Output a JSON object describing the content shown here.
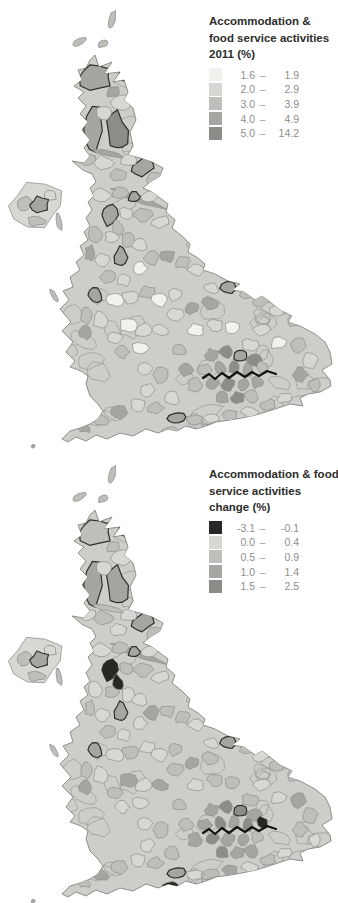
{
  "page": {
    "width": 338,
    "height": 903,
    "background": "#ffffff"
  },
  "legend_top": {
    "title_lines": [
      "Accommodation &",
      "food service activities",
      "2011 (%)"
    ],
    "dash": "–",
    "rows": [
      {
        "min": "1.6",
        "max": "1.9"
      },
      {
        "min": "2.0",
        "max": "2.9"
      },
      {
        "min": "3.0",
        "max": "3.9"
      },
      {
        "min": "4.0",
        "max": "4.9"
      },
      {
        "min": "5.0",
        "max": "14.2"
      }
    ]
  },
  "legend_bottom": {
    "title_lines": [
      "Accommodation & food",
      "service activities",
      "change (%)"
    ],
    "dash": "–",
    "rows": [
      {
        "min": "-3.1",
        "max": "-0.1"
      },
      {
        "min": "0.0",
        "max": "0.4"
      },
      {
        "min": "0.5",
        "max": "0.9"
      },
      {
        "min": "1.0",
        "max": "1.4"
      },
      {
        "min": "1.5",
        "max": "2.5"
      }
    ]
  },
  "map": {
    "type": "choropleth-cartogram",
    "area_shown": "Great Britain and Northern Ireland local authorities",
    "base_fill": "#cdcdc9",
    "outline_gray": "#8f8f8b",
    "outline_black": "#2e2e2c",
    "thames_color": "#141412",
    "palette_top": [
      "#f1f1ee",
      "#d7d7d3",
      "#bebeba",
      "#a5a5a1",
      "#8c8c89"
    ],
    "palette_bottom": [
      "#272725",
      "#d7d7d3",
      "#bebeba",
      "#a5a5a1",
      "#8c8c89"
    ],
    "offset_top": [
      0,
      0
    ],
    "offset_bottom": [
      0,
      455
    ],
    "thames": [
      [
        203,
        378
      ],
      [
        209,
        374
      ],
      [
        215,
        379
      ],
      [
        222,
        373
      ],
      [
        229,
        378
      ],
      [
        237,
        372
      ],
      [
        245,
        377
      ],
      [
        252,
        372
      ],
      [
        259,
        376
      ],
      [
        267,
        371
      ],
      [
        276,
        374
      ]
    ],
    "regions": [
      [
        95,
        77,
        16,
        13,
        0,
        3,
        2,
        1
      ],
      [
        130,
        73,
        11,
        7,
        -25,
        3,
        3,
        1
      ],
      [
        113,
        92,
        7,
        5,
        -15,
        3,
        2,
        0
      ],
      [
        121,
        103,
        10,
        8,
        0,
        1,
        1,
        0
      ],
      [
        94,
        130,
        10,
        21,
        5,
        3,
        3,
        1
      ],
      [
        117,
        132,
        10,
        20,
        -8,
        4,
        3,
        1
      ],
      [
        104,
        112,
        8,
        7,
        0,
        1,
        1,
        0
      ],
      [
        88,
        160,
        8,
        6,
        0,
        2,
        1,
        0
      ],
      [
        104,
        163,
        9,
        7,
        0,
        1,
        2,
        0
      ],
      [
        143,
        167,
        12,
        8,
        -20,
        3,
        3,
        1
      ],
      [
        155,
        178,
        9,
        6,
        -15,
        2,
        2,
        0
      ],
      [
        128,
        160,
        8,
        6,
        0,
        1,
        1,
        0
      ],
      [
        118,
        175,
        9,
        6,
        10,
        2,
        1,
        0
      ],
      [
        107,
        153,
        18,
        3,
        10,
        3,
        2,
        0
      ],
      [
        136,
        198,
        28,
        3,
        20,
        3,
        3,
        0
      ],
      [
        102,
        195,
        9,
        7,
        0,
        1,
        1,
        0
      ],
      [
        120,
        193,
        8,
        6,
        0,
        2,
        2,
        0
      ],
      [
        134,
        197,
        6,
        5,
        0,
        3,
        3,
        1
      ],
      [
        150,
        196,
        8,
        6,
        -10,
        1,
        1,
        0
      ],
      [
        110,
        215,
        8,
        10,
        0,
        3,
        0,
        1
      ],
      [
        126,
        213,
        7,
        6,
        0,
        1,
        2,
        0
      ],
      [
        118,
        228,
        5,
        8,
        -20,
        2,
        0,
        0
      ],
      [
        143,
        215,
        9,
        7,
        0,
        2,
        2,
        0
      ],
      [
        160,
        222,
        8,
        6,
        -15,
        1,
        1,
        0
      ],
      [
        95,
        235,
        7,
        8,
        0,
        2,
        1,
        0
      ],
      [
        112,
        237,
        7,
        6,
        0,
        1,
        2,
        0
      ],
      [
        128,
        240,
        7,
        9,
        0,
        2,
        1,
        0
      ],
      [
        121,
        257,
        6,
        10,
        5,
        3,
        3,
        1
      ],
      [
        140,
        245,
        8,
        6,
        0,
        1,
        1,
        0
      ],
      [
        90,
        253,
        5,
        8,
        0,
        3,
        2,
        0
      ],
      [
        103,
        260,
        7,
        7,
        0,
        1,
        1,
        0
      ],
      [
        152,
        258,
        8,
        7,
        0,
        2,
        3,
        0
      ],
      [
        168,
        256,
        7,
        6,
        0,
        3,
        2,
        0
      ],
      [
        183,
        262,
        8,
        6,
        -10,
        2,
        2,
        0
      ],
      [
        196,
        270,
        8,
        6,
        0,
        1,
        1,
        0
      ],
      [
        140,
        268,
        7,
        6,
        0,
        0,
        1,
        0
      ],
      [
        108,
        277,
        8,
        6,
        0,
        2,
        2,
        0
      ],
      [
        124,
        280,
        7,
        6,
        0,
        1,
        1,
        0
      ],
      [
        95,
        295,
        7,
        7,
        0,
        3,
        3,
        1
      ],
      [
        86,
        315,
        6,
        8,
        0,
        2,
        2,
        0
      ],
      [
        85,
        332,
        6,
        7,
        0,
        3,
        3,
        0
      ],
      [
        100,
        320,
        7,
        8,
        0,
        1,
        1,
        0
      ],
      [
        115,
        300,
        8,
        7,
        0,
        0,
        1,
        0
      ],
      [
        130,
        297,
        8,
        6,
        0,
        1,
        2,
        0
      ],
      [
        147,
        292,
        8,
        6,
        0,
        2,
        1,
        0
      ],
      [
        128,
        325,
        8,
        8,
        0,
        0,
        3,
        0
      ],
      [
        115,
        338,
        7,
        6,
        0,
        1,
        2,
        0
      ],
      [
        143,
        330,
        8,
        7,
        0,
        1,
        1,
        0
      ],
      [
        160,
        300,
        8,
        7,
        0,
        0,
        1,
        0
      ],
      [
        175,
        295,
        7,
        6,
        0,
        1,
        2,
        0
      ],
      [
        160,
        330,
        8,
        6,
        0,
        1,
        3,
        0
      ],
      [
        140,
        348,
        8,
        6,
        0,
        0,
        1,
        0
      ],
      [
        122,
        352,
        7,
        6,
        0,
        2,
        1,
        0
      ],
      [
        175,
        315,
        8,
        7,
        0,
        1,
        2,
        0
      ],
      [
        192,
        308,
        7,
        6,
        0,
        3,
        3,
        0
      ],
      [
        210,
        303,
        8,
        6,
        0,
        3,
        2,
        0
      ],
      [
        228,
        287,
        8,
        7,
        -10,
        3,
        3,
        1
      ],
      [
        247,
        292,
        8,
        6,
        0,
        2,
        2,
        0
      ],
      [
        212,
        288,
        7,
        5,
        0,
        1,
        1,
        0
      ],
      [
        196,
        330,
        8,
        6,
        0,
        0,
        1,
        0
      ],
      [
        215,
        325,
        8,
        6,
        0,
        1,
        2,
        0
      ],
      [
        232,
        328,
        7,
        6,
        0,
        0,
        2,
        0
      ],
      [
        262,
        300,
        9,
        6,
        -10,
        2,
        1,
        0
      ],
      [
        278,
        310,
        8,
        6,
        -15,
        1,
        2,
        0
      ],
      [
        295,
        320,
        8,
        6,
        -20,
        2,
        2,
        0
      ],
      [
        262,
        330,
        8,
        6,
        0,
        1,
        1,
        0
      ],
      [
        278,
        343,
        8,
        6,
        -15,
        0,
        1,
        0
      ],
      [
        298,
        345,
        8,
        7,
        -20,
        2,
        3,
        0
      ],
      [
        310,
        360,
        7,
        8,
        -10,
        1,
        2,
        0
      ],
      [
        300,
        375,
        7,
        7,
        0,
        3,
        2,
        0
      ],
      [
        315,
        385,
        6,
        7,
        0,
        2,
        1,
        0
      ],
      [
        250,
        345,
        8,
        6,
        0,
        1,
        2,
        0
      ],
      [
        212,
        355,
        7,
        6,
        0,
        3,
        3,
        0
      ],
      [
        226,
        352,
        7,
        6,
        0,
        4,
        4,
        0
      ],
      [
        240,
        356,
        7,
        6,
        0,
        3,
        4,
        1
      ],
      [
        254,
        360,
        7,
        6,
        0,
        4,
        3,
        0
      ],
      [
        205,
        370,
        7,
        6,
        0,
        2,
        3,
        0
      ],
      [
        220,
        368,
        6,
        6,
        0,
        3,
        4,
        0
      ],
      [
        234,
        368,
        6,
        6,
        0,
        4,
        3,
        0
      ],
      [
        248,
        370,
        6,
        6,
        0,
        3,
        4,
        0
      ],
      [
        262,
        368,
        6,
        6,
        0,
        2,
        0,
        0
      ],
      [
        212,
        383,
        7,
        6,
        0,
        3,
        4,
        0
      ],
      [
        228,
        385,
        7,
        6,
        0,
        4,
        3,
        0
      ],
      [
        243,
        384,
        6,
        6,
        0,
        3,
        3,
        0
      ],
      [
        257,
        382,
        6,
        6,
        0,
        3,
        2,
        0
      ],
      [
        222,
        398,
        7,
        6,
        0,
        3,
        4,
        0
      ],
      [
        238,
        398,
        7,
        6,
        0,
        4,
        3,
        0
      ],
      [
        195,
        385,
        7,
        7,
        0,
        2,
        3,
        0
      ],
      [
        186,
        370,
        7,
        6,
        0,
        3,
        2,
        0
      ],
      [
        252,
        396,
        7,
        6,
        0,
        2,
        3,
        0
      ],
      [
        180,
        350,
        7,
        6,
        0,
        2,
        2,
        0
      ],
      [
        172,
        398,
        8,
        6,
        0,
        1,
        2,
        0
      ],
      [
        176,
        418,
        9,
        6,
        -5,
        3,
        3,
        1
      ],
      [
        171,
        431,
        9,
        4,
        -12,
        2,
        0,
        0
      ],
      [
        195,
        420,
        8,
        5,
        0,
        2,
        1,
        0
      ],
      [
        212,
        418,
        8,
        5,
        0,
        1,
        2,
        0
      ],
      [
        230,
        415,
        8,
        5,
        0,
        2,
        3,
        0
      ],
      [
        250,
        412,
        8,
        5,
        -5,
        1,
        1,
        0
      ],
      [
        268,
        405,
        8,
        5,
        -10,
        2,
        2,
        0
      ],
      [
        285,
        398,
        7,
        5,
        -15,
        1,
        1,
        0
      ],
      [
        155,
        408,
        8,
        6,
        0,
        2,
        2,
        0
      ],
      [
        138,
        405,
        8,
        6,
        0,
        1,
        1,
        0
      ],
      [
        120,
        412,
        8,
        6,
        10,
        3,
        2,
        0
      ],
      [
        100,
        420,
        8,
        5,
        15,
        2,
        3,
        0
      ],
      [
        84,
        428,
        7,
        4,
        15,
        3,
        2,
        0
      ],
      [
        148,
        390,
        7,
        6,
        0,
        1,
        1,
        0
      ],
      [
        160,
        375,
        8,
        7,
        0,
        2,
        2,
        0
      ],
      [
        145,
        368,
        7,
        6,
        0,
        1,
        1,
        0
      ]
    ],
    "detached": [
      [
        112,
        20,
        3,
        10,
        15,
        2,
        2,
        0
      ],
      [
        79,
        42,
        8,
        3,
        -35,
        2,
        2,
        0
      ],
      [
        103,
        44,
        6,
        3,
        -20,
        2,
        2,
        0
      ],
      [
        59,
        222,
        3,
        8,
        -10,
        2,
        2,
        0
      ],
      [
        54,
        296,
        2.5,
        7,
        -25,
        2,
        2,
        0
      ],
      [
        33,
        446,
        2,
        2,
        0,
        3,
        3,
        0
      ],
      [
        36,
        206,
        26,
        21,
        0,
        1,
        1,
        0
      ],
      [
        24,
        203,
        8,
        7,
        0,
        2,
        2,
        0
      ],
      [
        36,
        221,
        9,
        5,
        0,
        2,
        2,
        0
      ],
      [
        50,
        196,
        7,
        5,
        0,
        1,
        1,
        0
      ],
      [
        40,
        205,
        9,
        8,
        0,
        3,
        3,
        1
      ]
    ]
  }
}
